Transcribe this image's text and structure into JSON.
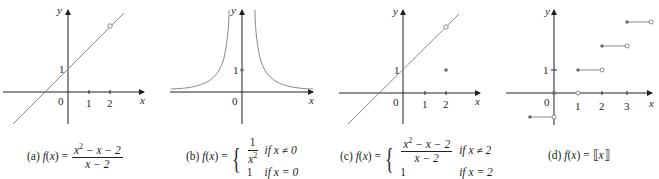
{
  "figure": {
    "panels": [
      {
        "id": "a",
        "caption_label": "(a)",
        "func_name": "f",
        "func_arg": "x",
        "equals": "=",
        "numerator": "x",
        "numerator_sup": "2",
        "numerator_rest": " − x − 2",
        "denominator": "x − 2",
        "axis_x_label": "x",
        "axis_y_label": "y",
        "origin_label": "0",
        "x_ticks": [
          "1",
          "2"
        ],
        "y_ticks": [
          "1"
        ],
        "features": "line y = x + 1 with open circle at (2, 3)"
      },
      {
        "id": "b",
        "caption_label": "(b)",
        "func_name": "f",
        "func_arg": "x",
        "equals": "=",
        "case1_num": "1",
        "case1_den": "x",
        "case1_den_sup": "2",
        "case1_cond": "if x ≠ 0",
        "case2_val": "1",
        "case2_cond": "if x = 0",
        "axis_x_label": "x",
        "axis_y_label": "y",
        "origin_label": "0",
        "y_ticks": [
          "1"
        ],
        "features": "curve y = 1/x^2 with filled dot at (0, 1)"
      },
      {
        "id": "c",
        "caption_label": "(c)",
        "func_name": "f",
        "func_arg": "x",
        "equals": "=",
        "case1_num": "x",
        "case1_num_sup": "2",
        "case1_num_rest": " − x − 2",
        "case1_den": "x − 2",
        "case1_cond": "if x ≠ 2",
        "case2_val": "1",
        "case2_cond": "if x = 2",
        "axis_x_label": "x",
        "axis_y_label": "y",
        "origin_label": "0",
        "x_ticks": [
          "1",
          "2"
        ],
        "y_ticks": [
          "1"
        ],
        "features": "line y = x + 1 with open circle at (2, 3), filled dot at (2, 1)"
      },
      {
        "id": "d",
        "caption_label": "(d)",
        "func_name": "f",
        "func_arg": "x",
        "equals": "=",
        "floor_left": "⟦",
        "floor_var": "x",
        "floor_right": "⟧",
        "axis_x_label": "x",
        "axis_y_label": "y",
        "origin_label": "0",
        "x_ticks": [
          "1",
          "2",
          "3"
        ],
        "y_ticks": [
          "1"
        ],
        "features": "greatest integer step function, filled left endpoints, open right endpoints"
      }
    ],
    "colors": {
      "axis": "#231f20",
      "curve": "#8a8a8a",
      "dot": "#6d6d6d",
      "background": "#ffffff"
    }
  }
}
